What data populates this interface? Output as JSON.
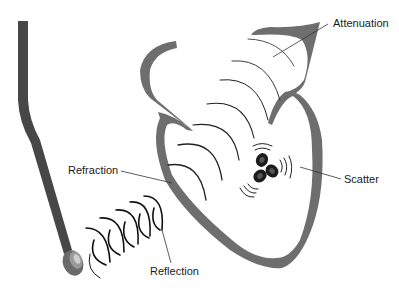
{
  "diagram": {
    "colors": {
      "heart_wall": "#6e6e6e",
      "probe": "#4a4a4a",
      "wave": "#222222",
      "leader": "#333333",
      "cells": "#1c1c1c"
    },
    "labels": [
      {
        "id": "attenuation",
        "text": "Attenuation"
      },
      {
        "id": "refraction",
        "text": "Refraction"
      },
      {
        "id": "scatter",
        "text": "Scatter"
      },
      {
        "id": "reflection",
        "text": "Reflection"
      }
    ],
    "elements": [
      {
        "id": "probe",
        "icon": "ultrasound-transducer-icon"
      },
      {
        "id": "heart",
        "icon": "heart-outline-icon"
      },
      {
        "id": "scatterers",
        "icon": "red-blood-cells-icon"
      }
    ]
  }
}
